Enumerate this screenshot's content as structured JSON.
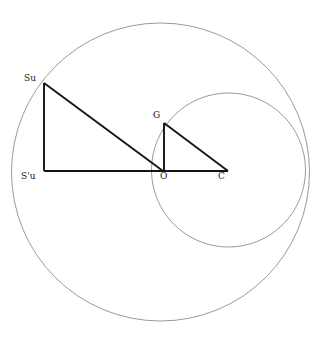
{
  "figure": {
    "width": 324,
    "height": 337,
    "background_color": "#ffffff"
  },
  "style": {
    "circle_stroke_color": "#808080",
    "circle_stroke_width": 0.8,
    "segment_stroke_color": "#141414",
    "segment_stroke_width": 1.9,
    "label_color": "#1a1a1a",
    "label_font_size": 9
  },
  "chart_data": {
    "type": "diagram",
    "circles": [
      {
        "name": "outer-circle",
        "cx": 160.5,
        "cy": 172,
        "r": 149,
        "stroke": "#808080"
      },
      {
        "name": "inner-circle",
        "cx": 228.5,
        "cy": 170,
        "r": 77,
        "stroke": "#808080"
      }
    ],
    "points": [
      {
        "id": "Su",
        "label": "Su",
        "x": 44,
        "y": 83,
        "label_x": 24,
        "label_y": 73
      },
      {
        "id": "Spu",
        "label": "S'u",
        "x": 44,
        "y": 171,
        "label_x": 21,
        "label_y": 171
      },
      {
        "id": "O",
        "label": "O",
        "x": 163,
        "y": 171,
        "label_x": 160,
        "label_y": 171
      },
      {
        "id": "C",
        "label": "C",
        "x": 228,
        "y": 171,
        "label_x": 218,
        "label_y": 171
      },
      {
        "id": "G",
        "label": "G",
        "x": 164,
        "y": 123,
        "label_x": 153,
        "label_y": 110
      }
    ],
    "segments": [
      {
        "name": "segment-su-spu",
        "from": "Su",
        "to": "Spu",
        "x1": 44,
        "y1": 83,
        "x2": 44,
        "y2": 171
      },
      {
        "name": "segment-spu-o",
        "from": "Spu",
        "to": "O",
        "x1": 44,
        "y1": 171,
        "x2": 163,
        "y2": 171
      },
      {
        "name": "segment-su-o",
        "from": "Su",
        "to": "O",
        "x1": 44,
        "y1": 83,
        "x2": 163,
        "y2": 171
      },
      {
        "name": "segment-g-o",
        "from": "G",
        "to": "O",
        "x1": 164,
        "y1": 123,
        "x2": 164,
        "y2": 171
      },
      {
        "name": "segment-o-c",
        "from": "O",
        "to": "C",
        "x1": 163,
        "y1": 171,
        "x2": 228,
        "y2": 171
      },
      {
        "name": "segment-g-c",
        "from": "G",
        "to": "C",
        "x1": 164,
        "y1": 123,
        "x2": 228,
        "y2": 171
      }
    ],
    "triangles": [
      {
        "name": "large-right-triangle",
        "vertices": [
          "Su",
          "Spu",
          "O"
        ]
      },
      {
        "name": "small-right-triangle",
        "vertices": [
          "G",
          "O",
          "C"
        ]
      }
    ]
  }
}
